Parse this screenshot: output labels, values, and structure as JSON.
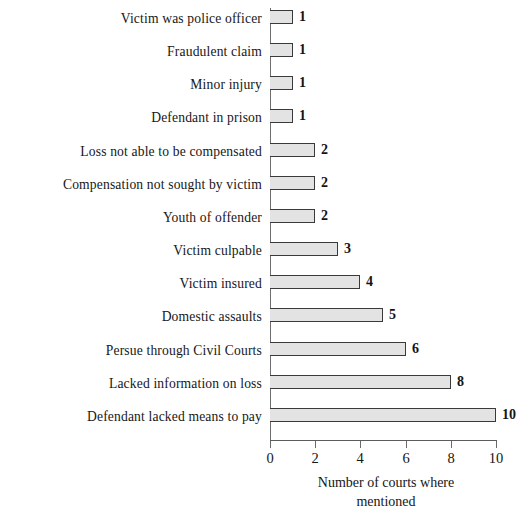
{
  "chart_data": {
    "type": "bar",
    "orientation": "horizontal",
    "title": "",
    "xlabel": "Number of courts where mentioned",
    "xlabel_lines": [
      "Number of courts where",
      "mentioned"
    ],
    "ylabel": "",
    "xlim": [
      0,
      10
    ],
    "xticks": [
      0,
      2,
      4,
      6,
      8,
      10
    ],
    "xtick_labels": [
      "0",
      "2",
      "4",
      "6",
      "8",
      "10"
    ],
    "grid": false,
    "legend": false,
    "bar_fill_color": "#e3e3e3",
    "bar_edge_color": "#3a3a3a",
    "axis_color": "#6e6e6e",
    "categories": [
      "Victim was police officer",
      "Fraudulent claim",
      "Minor injury",
      "Defendant in prison",
      "Loss not able to be compensated",
      "Compensation not sought by victim",
      "Youth of offender",
      "Victim culpable",
      "Victim insured",
      "Domestic assaults",
      "Persue through Civil Courts",
      "Lacked information on loss",
      "Defendant lacked means to pay"
    ],
    "values": [
      1,
      1,
      1,
      1,
      2,
      2,
      2,
      3,
      4,
      5,
      6,
      8,
      10
    ],
    "value_labels": [
      "1",
      "1",
      "1",
      "1",
      "2",
      "2",
      "2",
      "3",
      "4",
      "5",
      "6",
      "8",
      "10"
    ]
  }
}
